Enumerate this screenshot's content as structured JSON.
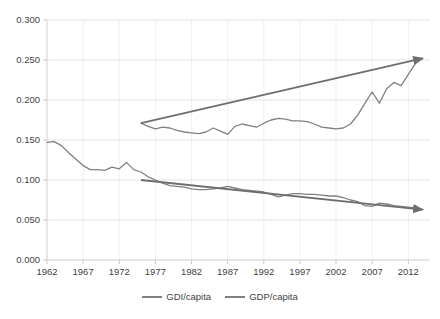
{
  "chart_data": {
    "type": "line",
    "title": "",
    "xlabel": "",
    "ylabel": "",
    "xlim": [
      1962,
      2015
    ],
    "ylim": [
      0.0,
      0.3
    ],
    "grid": true,
    "legend_position": "bottom",
    "ytick_labels": [
      "0.000",
      "0.050",
      "0.100",
      "0.150",
      "0.200",
      "0.250",
      "0.300"
    ],
    "ytick_values": [
      0.0,
      0.05,
      0.1,
      0.15,
      0.2,
      0.25,
      0.3
    ],
    "xtick_labels": [
      "1962",
      "1967",
      "1972",
      "1977",
      "1982",
      "1987",
      "1992",
      "1997",
      "2002",
      "2007",
      "2012"
    ],
    "xtick_values": [
      1962,
      1967,
      1972,
      1977,
      1982,
      1987,
      1992,
      1997,
      2002,
      2007,
      2012
    ],
    "series": [
      {
        "name": "GDI/capita",
        "color": "#808080",
        "x": [
          1975,
          1976,
          1977,
          1978,
          1979,
          1980,
          1981,
          1982,
          1983,
          1984,
          1985,
          1986,
          1987,
          1988,
          1989,
          1990,
          1991,
          1992,
          1993,
          1994,
          1995,
          1996,
          1997,
          1998,
          1999,
          2000,
          2001,
          2002,
          2003,
          2004,
          2005,
          2006,
          2007,
          2008,
          2009,
          2010,
          2011,
          2012,
          2013,
          2014
        ],
        "values": [
          0.171,
          0.167,
          0.164,
          0.166,
          0.165,
          0.162,
          0.16,
          0.159,
          0.158,
          0.16,
          0.165,
          0.161,
          0.157,
          0.167,
          0.17,
          0.168,
          0.166,
          0.171,
          0.175,
          0.177,
          0.176,
          0.174,
          0.174,
          0.173,
          0.17,
          0.166,
          0.165,
          0.164,
          0.165,
          0.17,
          0.181,
          0.196,
          0.21,
          0.196,
          0.214,
          0.222,
          0.218,
          0.232,
          0.246,
          0.252
        ]
      },
      {
        "name": "GDP/capita",
        "color": "#808080",
        "x": [
          1962,
          1963,
          1964,
          1965,
          1966,
          1967,
          1968,
          1969,
          1970,
          1971,
          1972,
          1973,
          1974,
          1975,
          1976,
          1977,
          1978,
          1979,
          1980,
          1981,
          1982,
          1983,
          1984,
          1985,
          1986,
          1987,
          1988,
          1989,
          1990,
          1991,
          1992,
          1993,
          1994,
          1995,
          1996,
          1997,
          1998,
          1999,
          2000,
          2001,
          2002,
          2003,
          2004,
          2005,
          2006,
          2007,
          2008,
          2009,
          2010,
          2011,
          2012,
          2013,
          2014
        ],
        "values": [
          0.147,
          0.148,
          0.143,
          0.134,
          0.126,
          0.118,
          0.113,
          0.113,
          0.112,
          0.116,
          0.114,
          0.122,
          0.113,
          0.11,
          0.104,
          0.1,
          0.096,
          0.093,
          0.092,
          0.091,
          0.089,
          0.088,
          0.088,
          0.089,
          0.09,
          0.092,
          0.09,
          0.088,
          0.087,
          0.086,
          0.085,
          0.082,
          0.079,
          0.081,
          0.083,
          0.083,
          0.082,
          0.082,
          0.081,
          0.08,
          0.08,
          0.078,
          0.075,
          0.073,
          0.068,
          0.067,
          0.071,
          0.07,
          0.068,
          0.067,
          0.066,
          0.065,
          0.063
        ]
      }
    ],
    "annotations": [
      {
        "name": "gdi-trend-arrow",
        "type": "arrow",
        "direction": "up",
        "x_start": 1975,
        "y_start": 0.171,
        "x_end": 2014.5,
        "y_end": 0.252,
        "color": "#6e6e6e"
      },
      {
        "name": "gdp-trend-arrow",
        "type": "arrow",
        "direction": "down",
        "x_start": 1975,
        "y_start": 0.1,
        "x_end": 2014.5,
        "y_end": 0.063,
        "color": "#6e6e6e"
      }
    ]
  }
}
